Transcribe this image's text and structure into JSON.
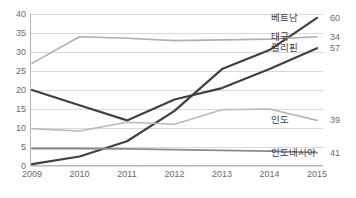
{
  "chart_data": {
    "type": "line",
    "title": "",
    "subtitle": "",
    "xlabel": "",
    "ylabel": "",
    "x": [
      2009,
      2010,
      2011,
      2012,
      2013,
      2014,
      2015
    ],
    "xtick_labels": [
      "2009",
      "2010",
      "2011",
      "2012",
      "2013",
      "2014",
      "2015"
    ],
    "ytick_labels": [
      "0",
      "5",
      "10",
      "15",
      "20",
      "25",
      "30",
      "35",
      "40"
    ],
    "yticks": [
      0,
      5,
      10,
      15,
      20,
      25,
      30,
      35,
      40
    ],
    "ylim": [
      0,
      40
    ],
    "grid": true,
    "legend_position": "right-end-of-line",
    "series": [
      {
        "name": "베트남",
        "end_value_label": "60",
        "color": "#404040",
        "width": 2.2,
        "values": [
          0.5,
          2.5,
          6.5,
          14.5,
          25.5,
          30.5,
          39.0
        ]
      },
      {
        "name": "태국",
        "end_value_label": "34",
        "color": "#b0b0b0",
        "width": 1.6,
        "values": [
          27.0,
          34.0,
          33.6,
          33.0,
          33.2,
          33.4,
          34.0
        ]
      },
      {
        "name": "필리핀",
        "end_value_label": "57",
        "color": "#404040",
        "width": 2.2,
        "values": [
          20.0,
          16.0,
          12.0,
          17.5,
          20.5,
          25.5,
          31.0
        ]
      },
      {
        "name": "인도",
        "end_value_label": "39",
        "color": "#b8b8b8",
        "width": 1.6,
        "values": [
          9.8,
          9.2,
          11.5,
          11.0,
          14.8,
          15.0,
          12.0
        ]
      },
      {
        "name": "인도네시아",
        "end_value_label": "41",
        "color": "#8a8a8a",
        "width": 1.8,
        "values": [
          4.6,
          4.6,
          4.5,
          4.3,
          4.1,
          3.9,
          3.5
        ]
      }
    ]
  }
}
